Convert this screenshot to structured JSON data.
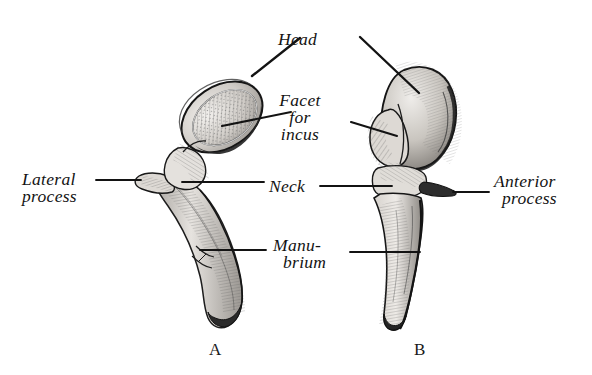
{
  "figure": {
    "background_color": "#ffffff",
    "ink_color": "#131313",
    "specimens": [
      {
        "letter": "A",
        "x": 215,
        "y": 354
      },
      {
        "letter": "B",
        "x": 419,
        "y": 354
      }
    ]
  },
  "labels": {
    "head": {
      "text": "Head",
      "x": 306,
      "y": 44
    },
    "facet_line1": {
      "text": "Facet",
      "x": 300,
      "y": 105
    },
    "facet_line2": {
      "text": "for",
      "x": 300,
      "y": 125
    },
    "facet_line3": {
      "text": "incus",
      "x": 300,
      "y": 145
    },
    "neck": {
      "text": "Neck",
      "x": 272,
      "y": 191
    },
    "manubrium_line1": {
      "text": "Manu-",
      "x": 276,
      "y": 250
    },
    "manubrium_line2": {
      "text": "brium",
      "x": 276,
      "y": 270
    },
    "lateral_line1": {
      "text": "Lateral",
      "x": 24,
      "y": 184
    },
    "lateral_line2": {
      "text": "process",
      "x": 24,
      "y": 202
    },
    "anterior_line1": {
      "text": "Anterior",
      "x": 497,
      "y": 186
    },
    "anterior_line2": {
      "text": "process",
      "x": 497,
      "y": 204
    }
  },
  "leader_lines": [
    {
      "name": "head-to-specimen-a",
      "from": [
        300,
        38
      ],
      "to": [
        252,
        76
      ]
    },
    {
      "name": "head-to-specimen-b",
      "from": [
        360,
        37
      ],
      "to": [
        419,
        93
      ]
    },
    {
      "name": "facet-to-specimen-a",
      "from": [
        291,
        112
      ],
      "to": [
        222,
        126
      ]
    },
    {
      "name": "facet-to-specimen-b",
      "from": [
        351,
        122
      ],
      "to": [
        397,
        136
      ]
    },
    {
      "name": "neck-to-specimen-a",
      "from": [
        264,
        182
      ],
      "to": [
        182,
        182
      ]
    },
    {
      "name": "neck-to-specimen-b",
      "from": [
        320,
        186
      ],
      "to": [
        390,
        186
      ]
    },
    {
      "name": "manubrium-to-specimen-a",
      "from": [
        266,
        250
      ],
      "to": [
        200,
        250
      ]
    },
    {
      "name": "manubrium-to-specimen-b",
      "from": [
        350,
        252
      ],
      "to": [
        420,
        252
      ]
    },
    {
      "name": "lateral-process-leader",
      "from": [
        96,
        180
      ],
      "to": [
        140,
        180
      ]
    },
    {
      "name": "anterior-process-leader",
      "from": [
        455,
        192
      ],
      "to": [
        489,
        192
      ]
    }
  ]
}
